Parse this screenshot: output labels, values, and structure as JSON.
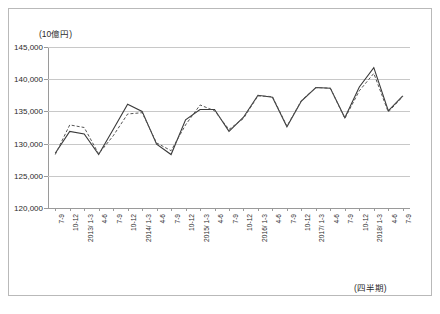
{
  "chart_data": {
    "type": "line",
    "title": "",
    "subtitle": "",
    "ylabel": "(10億円)",
    "xlabel": "(四半期)",
    "ylim": [
      120000,
      145000
    ],
    "ytick_values": [
      145000,
      140000,
      135000,
      130000,
      125000,
      120000
    ],
    "ytick_labels": [
      "145,000",
      "140,000",
      "135,000",
      "130,000",
      "125,000",
      "120,000"
    ],
    "grid": true,
    "legend": "none",
    "categories": [
      "7-9",
      "10-12",
      "2013/ 1-3",
      "4-6",
      "7-9",
      "10-12",
      "2014/ 1-3",
      "4-6",
      "7-9",
      "10-12",
      "2015/ 1-3",
      "4-6",
      "7-9",
      "10-12",
      "2016/ 1-3",
      "4-6",
      "7-9",
      "10-12",
      "2017/ 1-3",
      "4-6",
      "7-9",
      "10-12",
      "2018/ 1-3",
      "4-6",
      "7-9"
    ],
    "series": [
      {
        "name": "solid-line",
        "style": "solid",
        "color": "#3a3a3a",
        "values": [
          128500,
          131900,
          131500,
          128300,
          132200,
          136100,
          135000,
          129900,
          128300,
          133700,
          135300,
          135300,
          131900,
          134100,
          137500,
          137200,
          132600,
          136600,
          138700,
          138600,
          134000,
          138800,
          141800,
          135100,
          137400
        ]
      },
      {
        "name": "dashed-line",
        "style": "dashed",
        "color": "#555555",
        "values": [
          128300,
          132900,
          132500,
          128400,
          131200,
          134600,
          134800,
          130100,
          128900,
          132900,
          136000,
          135100,
          132200,
          133900,
          137400,
          137300,
          132700,
          136700,
          138700,
          138600,
          133900,
          138200,
          140900,
          134900,
          137300
        ]
      }
    ]
  }
}
